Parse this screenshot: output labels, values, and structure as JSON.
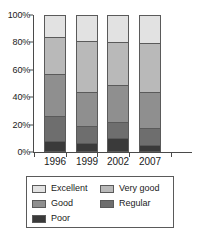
{
  "chart_data": {
    "type": "bar",
    "stacked": true,
    "normalized": true,
    "title": "",
    "xlabel": "",
    "ylabel": "",
    "categories": [
      "1996",
      "1999",
      "2002",
      "2007"
    ],
    "ylim": [
      0,
      100
    ],
    "yticks": [
      "0%",
      "20%",
      "40%",
      "60%",
      "80%",
      "100%"
    ],
    "ytick_values": [
      0,
      20,
      40,
      60,
      80,
      100
    ],
    "grid": false,
    "legend_position": "bottom",
    "series": [
      {
        "name": "Excellent",
        "color": "#e2e2e2",
        "values": [
          16,
          19,
          20,
          21
        ]
      },
      {
        "name": "Very good",
        "color": "#b9b9b9",
        "values": [
          28,
          38,
          32,
          36
        ]
      },
      {
        "name": "Good",
        "color": "#8f8f8f",
        "values": [
          31,
          25,
          27,
          27
        ]
      },
      {
        "name": "Regular",
        "color": "#6e6e6e",
        "values": [
          18,
          13,
          12,
          12
        ]
      },
      {
        "name": "Poor",
        "color": "#3a3a3a",
        "values": [
          7,
          5,
          9,
          4
        ]
      }
    ]
  },
  "legend": {
    "order": [
      "Excellent",
      "Very good",
      "Good",
      "Regular",
      "Poor"
    ]
  }
}
